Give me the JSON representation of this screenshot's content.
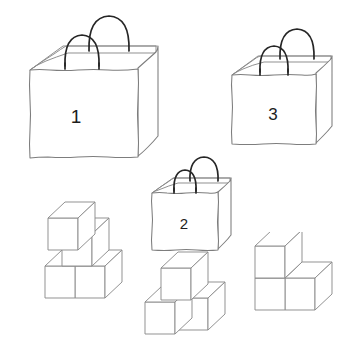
{
  "canvas": {
    "width": 363,
    "height": 345,
    "background": "#ffffff",
    "description": "Line-drawing puzzle: three numbered paper shopping bags above three isometric cube-block arrangements"
  },
  "palette": {
    "paper_outline": "#7d7d7d",
    "bag_inner_outline": "#8a8a8a",
    "handle": "#262626",
    "cube_outline": "#8c8c8c",
    "label_text": "#1d1d1d",
    "background": "#ffffff"
  },
  "bags": [
    {
      "id": "bag-1",
      "label": "1",
      "size": "large",
      "label_font_size": 19,
      "label_x": 76,
      "label_y": 116,
      "handles": 2
    },
    {
      "id": "bag-2",
      "label": "2",
      "size": "small",
      "label_font_size": 15,
      "label_x": 188,
      "label_y": 213,
      "handles": 2
    },
    {
      "id": "bag-3",
      "label": "3",
      "size": "medium",
      "label_font_size": 17,
      "label_x": 273,
      "label_y": 114,
      "handles": 2
    }
  ],
  "cube_groups": [
    {
      "id": "cube-group-left",
      "cube_count": 4,
      "arrangement": "staircase: two cubes bottom row, one cube middle level, one cube top level",
      "levels": 3
    },
    {
      "id": "cube-group-middle",
      "cube_count": 3,
      "arrangement": "two cubes bottom row, one cube on top of the left-rear cube",
      "levels": 2
    },
    {
      "id": "cube-group-right",
      "cube_count": 3,
      "arrangement": "two cubes bottom row, one cube on top of the left cube",
      "levels": 2
    }
  ]
}
